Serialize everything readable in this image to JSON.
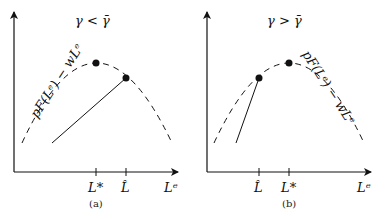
{
  "panels": [
    {
      "id": "a",
      "title": "γ < γ̄",
      "curve_label": "pF(Lᵉ) − wLᵉ",
      "x_ticks": [
        {
          "label": "L*",
          "position": "peak"
        },
        {
          "label": "L̂",
          "position": "right-of-peak"
        }
      ],
      "x_axis_label": "Lᵉ",
      "caption": "(a)"
    },
    {
      "id": "b",
      "title": "γ > γ̄",
      "curve_label": "pF(Lᵉ) − wLᵉ",
      "x_ticks": [
        {
          "label": "L̂",
          "position": "left-of-peak"
        },
        {
          "label": "L*",
          "position": "peak"
        }
      ],
      "x_axis_label": "Lᵉ",
      "caption": "(b)"
    }
  ],
  "colors": {
    "ink": "#111111",
    "background": "#ffffff"
  }
}
